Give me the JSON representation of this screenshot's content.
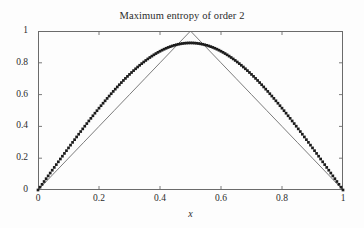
{
  "chart_data": {
    "type": "line",
    "title": "Maximum entropy of order 2",
    "xlabel": "x",
    "ylabel": "",
    "xlim": [
      0,
      1
    ],
    "ylim": [
      0,
      1
    ],
    "grid": false,
    "legend": "none",
    "xticks": [
      "0",
      "0.2",
      "0.4",
      "0.6",
      "0.8",
      "1"
    ],
    "xtick_values": [
      0,
      0.2,
      0.4,
      0.6,
      0.8,
      1
    ],
    "yticks": [
      "0",
      "0.2",
      "0.4",
      "0.6",
      "0.8",
      "1"
    ],
    "ytick_values": [
      0,
      0.2,
      0.4,
      0.6,
      0.8,
      1
    ],
    "series": [
      {
        "name": "triangular bound",
        "style": "solid-thin",
        "color": "#6d6d6d",
        "x": [
          0,
          0.05,
          0.1,
          0.15,
          0.2,
          0.25,
          0.3,
          0.35,
          0.4,
          0.45,
          0.5,
          0.55,
          0.6,
          0.65,
          0.7,
          0.75,
          0.8,
          0.85,
          0.9,
          0.95,
          1
        ],
        "values": [
          0,
          0.1,
          0.2,
          0.3,
          0.4,
          0.5,
          0.6,
          0.7,
          0.8,
          0.9,
          1,
          0.9,
          0.8,
          0.7,
          0.6,
          0.5,
          0.4,
          0.3,
          0.2,
          0.1,
          0
        ]
      },
      {
        "name": "maximum entropy of order 2",
        "style": "dotted-thick",
        "color": "#1c1c1c",
        "x": [
          0,
          0.02,
          0.04,
          0.06,
          0.08,
          0.1,
          0.12,
          0.14,
          0.16,
          0.18,
          0.2,
          0.22,
          0.24,
          0.26,
          0.28,
          0.3,
          0.32,
          0.34,
          0.36,
          0.38,
          0.4,
          0.42,
          0.44,
          0.46,
          0.48,
          0.5,
          0.52,
          0.54,
          0.56,
          0.58,
          0.6,
          0.62,
          0.64,
          0.66,
          0.68,
          0.7,
          0.72,
          0.74,
          0.76,
          0.78,
          0.8,
          0.82,
          0.84,
          0.86,
          0.88,
          0.9,
          0.92,
          0.94,
          0.96,
          0.98,
          1
        ],
        "values": [
          0,
          0.041,
          0.082,
          0.122,
          0.162,
          0.202,
          0.241,
          0.28,
          0.319,
          0.357,
          0.395,
          0.432,
          0.468,
          0.504,
          0.539,
          0.573,
          0.606,
          0.638,
          0.669,
          0.699,
          0.727,
          0.754,
          0.779,
          0.802,
          0.823,
          0.925,
          0.823,
          0.802,
          0.779,
          0.754,
          0.727,
          0.699,
          0.669,
          0.638,
          0.606,
          0.573,
          0.539,
          0.504,
          0.468,
          0.432,
          0.395,
          0.357,
          0.319,
          0.28,
          0.241,
          0.202,
          0.162,
          0.122,
          0.082,
          0.041,
          0
        ],
        "peak": 0.925,
        "peak_x": 0.5
      }
    ]
  },
  "axes": {
    "box_color": "#6b6b6b",
    "tick_direction": "in",
    "background": "#fdfdfd"
  }
}
